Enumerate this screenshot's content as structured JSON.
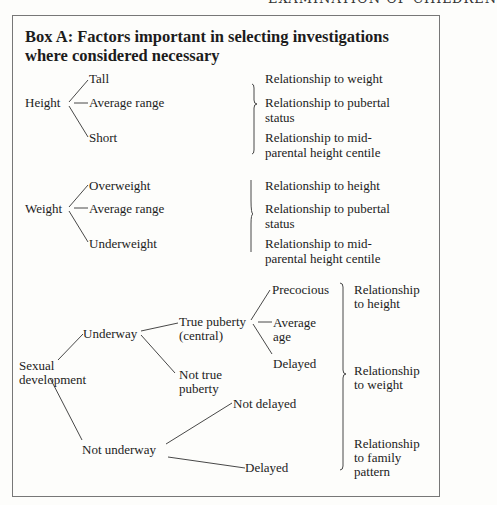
{
  "running_head": "EXAMINATION OF CHILDREN",
  "box": {
    "title": "Box A: Factors important in selecting investigations where considered necessary"
  },
  "height_section": {
    "root": "Height",
    "branches": [
      "Tall",
      "Average range",
      "Short"
    ],
    "relationships": [
      "Relationship to weight",
      "Relationship to pubertal",
      "status",
      "Relationship to mid-",
      "parental height centile"
    ]
  },
  "weight_section": {
    "root": "Weight",
    "branches": [
      "Overweight",
      "Average range",
      "Underweight"
    ],
    "relationships": [
      "Relationship to height",
      "Relationship to pubertal",
      "status",
      "Relationship to mid-",
      "parental height centile"
    ]
  },
  "sexual_section": {
    "root_line1": "Sexual",
    "root_line2": "development",
    "underway": "Underway",
    "true_puberty_line1": "True puberty",
    "true_puberty_line2": "(central)",
    "not_true_line1": "Not true",
    "not_true_line2": "puberty",
    "precocious": "Precocious",
    "average_line1": "Average",
    "average_line2": "age",
    "delayed_tp": "Delayed",
    "not_underway": "Not underway",
    "not_delayed": "Not delayed",
    "delayed_nu": "Delayed",
    "relationships": [
      "Relationship",
      "to height",
      "Relationship",
      "to weight",
      "Relationship",
      "to family",
      "pattern"
    ]
  }
}
